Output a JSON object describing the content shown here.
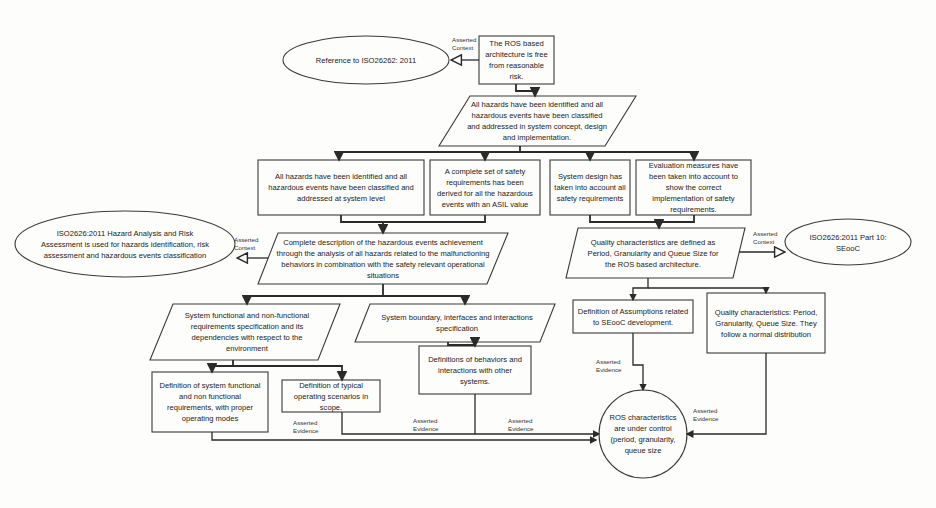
{
  "diagram": {
    "type": "GSN safety argument",
    "nodes": {
      "top_goal": "The ROS based architecture is free from reasonable risk.",
      "ctx_iso": "Reference to ISO26262: 2011",
      "strategy_main": "All hazards have been identified and all hazardous events have been classified and addressed in system concept, design and implementation.",
      "goal_system_level": "All hazards have been identified and all hazardous events have been classified and addressed at system level",
      "goal_safety_reqs": "A complete set of safety requirements has been derived for all the hazardous events with an ASIL value",
      "goal_system_design": "System design has taken into account all safety requirements",
      "goal_evaluation": "Evaluation measures have been taken into account to show the correct implementation of safety requirements.",
      "ctx_hara": "ISO2626:2011 Hazard Analysis and Risk Assessment is used for hazards identification, risk assessment and hazardous events classification",
      "strategy_description": "Complete description of the hazardous events achievement through the analysis of all hazards related to the malfunctioning behaviors in combination with the safety relevant operational situations",
      "strategy_quality": "Quality characteristics are defined as Period, Granularity and Queue Size for the ROS based architecture.",
      "ctx_seooc": "ISO2626:2011 Part 10: SEooC",
      "strategy_functional": "System functional and non-functional requirements specification and its dependencies with respect to the environment",
      "strategy_boundary": "System boundary, interfaces and interactions specification",
      "goal_def_assumptions": "Definition of Assumptions related to SEooC development.",
      "goal_quality_dist": "Quality characteristics: Period, Granularity, Queue Size. They follow a normal distribution",
      "goal_def_functional": "Definition of system functional and non functional requirements, with proper operating modes",
      "goal_def_scenarios": "Definition of typical operating scenarios in scope.",
      "goal_def_behaviors": "Definitions of behaviors and interactions with other systems.",
      "solution_ros": "ROS characteristics are under control (period, granularity, queue size"
    },
    "labels": {
      "asserted_context": "Asserted Context",
      "asserted_evidence": "Asserted Evidence"
    }
  }
}
